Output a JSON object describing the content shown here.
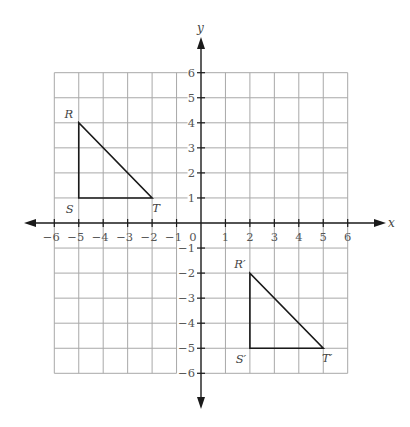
{
  "diagram": {
    "type": "coordinate-plane",
    "axes": {
      "x_label": "x",
      "y_label": "y",
      "x_range": [
        -6,
        6
      ],
      "y_range": [
        -6,
        6
      ],
      "origin_label": "0",
      "x_tick_labels": [
        "−6",
        "−5",
        "−4",
        "−3",
        "−2",
        "−1",
        "1",
        "2",
        "3",
        "4",
        "5",
        "6"
      ],
      "x_tick_values": [
        -6,
        -5,
        -4,
        -3,
        -2,
        -1,
        1,
        2,
        3,
        4,
        5,
        6
      ],
      "y_tick_labels": [
        "6",
        "5",
        "4",
        "3",
        "2",
        "1",
        "−1",
        "−2",
        "−3",
        "−4",
        "−5",
        "−6"
      ],
      "y_tick_values": [
        6,
        5,
        4,
        3,
        2,
        1,
        -1,
        -2,
        -3,
        -4,
        -5,
        -6
      ]
    },
    "grid": {
      "on": true,
      "spacing": 1,
      "color": "#a8a8a8"
    },
    "shapes": [
      {
        "name": "triangle-RST",
        "vertices": [
          {
            "label": "R",
            "x": -5,
            "y": 4
          },
          {
            "label": "S",
            "x": -5,
            "y": 1
          },
          {
            "label": "T",
            "x": -2,
            "y": 1
          }
        ]
      },
      {
        "name": "triangle-R'S'T'",
        "vertices": [
          {
            "label": "R′",
            "x": 2,
            "y": -2
          },
          {
            "label": "S′",
            "x": 2,
            "y": -5
          },
          {
            "label": "T′",
            "x": 5,
            "y": -5
          }
        ]
      }
    ],
    "colors": {
      "axis": "#1a1a1a",
      "shape_stroke": "#1a1a1a",
      "grid": "#a8a8a8",
      "background": "#ffffff"
    }
  }
}
